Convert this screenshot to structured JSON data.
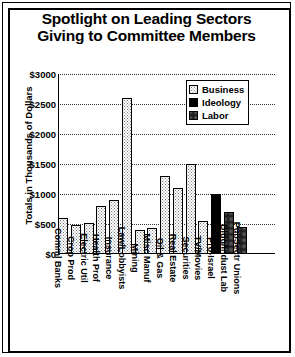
{
  "chart_data": {
    "type": "bar",
    "title": "Spotlight on Leading Sectors Giving to Committee Members",
    "title_line1": "Spotlight on Leading Sectors",
    "title_line2": "Giving to Committee Members",
    "xlabel": "",
    "ylabel": "Totals in Thousands of Dollars",
    "ylim": [
      0,
      3000
    ],
    "ytick_labels": [
      "$3000",
      "$2500",
      "$2000",
      "$1500",
      "$1000",
      "$500",
      "$0"
    ],
    "ytick_values": [
      3000,
      2500,
      2000,
      1500,
      1000,
      500,
      0
    ],
    "grid": true,
    "legend_position": "upper right",
    "legend": [
      {
        "name": "Business",
        "pattern": "pat-business"
      },
      {
        "name": "Ideology",
        "pattern": "pat-ideology"
      },
      {
        "name": "Labor",
        "pattern": "pat-labor"
      }
    ],
    "categories": [
      "Comml Banks",
      "Crop Prod",
      "Electric Util",
      "Health Prof",
      "Insurance",
      "Law/Lobbyists",
      "Mining",
      "Misc Manuf",
      "Oil & Gas",
      "Real Estate",
      "Securities",
      "TV/Movies",
      "Pro-Israel",
      "Bldg/Indust Lab",
      "PubSectr Unions"
    ],
    "values": [
      600,
      480,
      520,
      800,
      900,
      2600,
      400,
      430,
      1300,
      1100,
      1500,
      550,
      1000,
      700,
      450
    ],
    "groups": [
      "Business",
      "Business",
      "Business",
      "Business",
      "Business",
      "Business",
      "Business",
      "Business",
      "Business",
      "Business",
      "Business",
      "Business",
      "Ideology",
      "Labor",
      "Labor"
    ],
    "bars": [
      {
        "label": "Comml Banks",
        "value": 600,
        "group": "Business",
        "pattern": "pat-business"
      },
      {
        "label": "Crop Prod",
        "value": 480,
        "group": "Business",
        "pattern": "pat-business"
      },
      {
        "label": "Electric Util",
        "value": 520,
        "group": "Business",
        "pattern": "pat-business"
      },
      {
        "label": "Health Prof",
        "value": 800,
        "group": "Business",
        "pattern": "pat-business"
      },
      {
        "label": "Insurance",
        "value": 900,
        "group": "Business",
        "pattern": "pat-business"
      },
      {
        "label": "Law/Lobbyists",
        "value": 2600,
        "group": "Business",
        "pattern": "pat-business"
      },
      {
        "label": "Mining",
        "value": 400,
        "group": "Business",
        "pattern": "pat-business"
      },
      {
        "label": "Misc Manuf",
        "value": 430,
        "group": "Business",
        "pattern": "pat-business"
      },
      {
        "label": "Oil & Gas",
        "value": 1300,
        "group": "Business",
        "pattern": "pat-business"
      },
      {
        "label": "Real Estate",
        "value": 1100,
        "group": "Business",
        "pattern": "pat-business"
      },
      {
        "label": "Securities",
        "value": 1500,
        "group": "Business",
        "pattern": "pat-business"
      },
      {
        "label": "TV/Movies",
        "value": 550,
        "group": "Business",
        "pattern": "pat-business"
      },
      {
        "label": "Pro-Israel",
        "value": 1000,
        "group": "Ideology",
        "pattern": "pat-ideology"
      },
      {
        "label": "Bldg/Indust Lab",
        "value": 700,
        "group": "Labor",
        "pattern": "pat-labor"
      },
      {
        "label": "PubSectr Unions",
        "value": 450,
        "group": "Labor",
        "pattern": "pat-labor"
      }
    ]
  },
  "colors": {
    "ink": "#000000",
    "paper": "#ffffff",
    "grid": "#333333"
  }
}
